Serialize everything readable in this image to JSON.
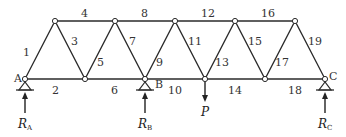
{
  "diagram": {
    "type": "truss",
    "nodes": {
      "bottom": [
        {
          "id": "A",
          "label": "A",
          "x": 25,
          "y": 79
        },
        {
          "id": "n2",
          "label": "",
          "x": 85,
          "y": 79
        },
        {
          "id": "B",
          "label": "B",
          "x": 145,
          "y": 79
        },
        {
          "id": "n4",
          "label": "",
          "x": 205,
          "y": 79
        },
        {
          "id": "n5",
          "label": "",
          "x": 265,
          "y": 79
        },
        {
          "id": "C",
          "label": "C",
          "x": 325,
          "y": 79
        }
      ],
      "top": [
        {
          "id": "t1",
          "x": 55,
          "y": 21
        },
        {
          "id": "t2",
          "x": 115,
          "y": 21
        },
        {
          "id": "t3",
          "x": 175,
          "y": 21
        },
        {
          "id": "t4",
          "x": 235,
          "y": 21
        },
        {
          "id": "t5",
          "x": 295,
          "y": 21
        }
      ]
    },
    "members": [
      {
        "n": "1",
        "lx": 23,
        "ly": 56
      },
      {
        "n": "2",
        "lx": 52,
        "ly": 94
      },
      {
        "n": "3",
        "lx": 71,
        "ly": 45
      },
      {
        "n": "4",
        "lx": 81,
        "ly": 17
      },
      {
        "n": "5",
        "lx": 97,
        "ly": 66
      },
      {
        "n": "6",
        "lx": 111,
        "ly": 94
      },
      {
        "n": "7",
        "lx": 129,
        "ly": 45
      },
      {
        "n": "8",
        "lx": 141,
        "ly": 17
      },
      {
        "n": "9",
        "lx": 156,
        "ly": 66
      },
      {
        "n": "10",
        "lx": 168,
        "ly": 94
      },
      {
        "n": "11",
        "lx": 188,
        "ly": 45
      },
      {
        "n": "12",
        "lx": 201,
        "ly": 17
      },
      {
        "n": "13",
        "lx": 215,
        "ly": 66
      },
      {
        "n": "14",
        "lx": 228,
        "ly": 94
      },
      {
        "n": "15",
        "lx": 248,
        "ly": 45
      },
      {
        "n": "16",
        "lx": 261,
        "ly": 17
      },
      {
        "n": "17",
        "lx": 275,
        "ly": 66
      },
      {
        "n": "18",
        "lx": 288,
        "ly": 94
      },
      {
        "n": "19",
        "lx": 308,
        "ly": 45
      }
    ],
    "reactions": {
      "RA": {
        "main": "R",
        "sub": "A"
      },
      "RB": {
        "main": "R",
        "sub": "B"
      },
      "RC": {
        "main": "R",
        "sub": "C"
      }
    },
    "load": {
      "label": "P"
    },
    "labels": {
      "A": "A",
      "B": "B",
      "C": "C"
    }
  }
}
